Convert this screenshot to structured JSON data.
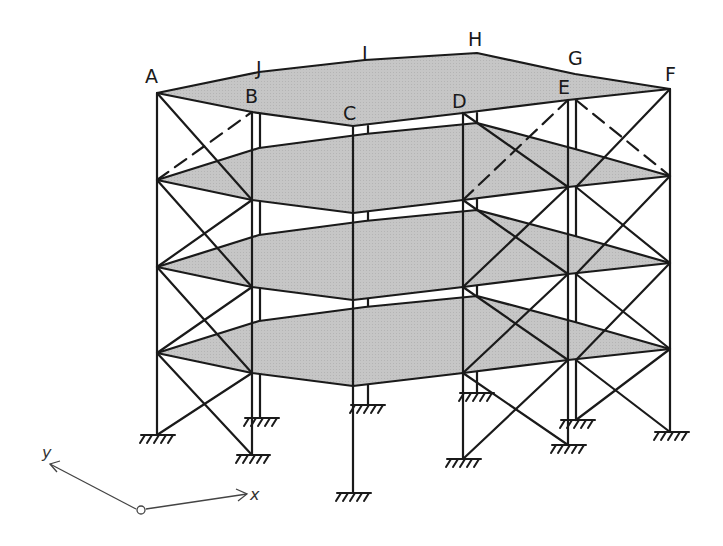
{
  "diagram": {
    "title": "",
    "type": "3D braced steel frame, 4 storeys, fixed supports",
    "colors": {
      "line": "#1a1a1a",
      "slab_fill": "#c4c4c4",
      "axis": "#444444",
      "background": "#ffffff"
    },
    "node_labels": {
      "A": "A",
      "B": "B",
      "C": "C",
      "D": "D",
      "E": "E",
      "F": "F",
      "G": "G",
      "H": "H",
      "I": "I",
      "J": "J"
    },
    "axes": {
      "x_label": "x",
      "y_label": "y"
    },
    "storeys": 4,
    "support_type": "fixed"
  }
}
